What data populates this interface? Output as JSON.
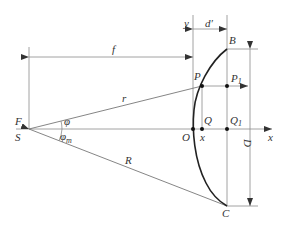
{
  "diagram": {
    "labels": {
      "f": "f",
      "y": "y",
      "d_prime": "d′",
      "B": "B",
      "P": "P",
      "P1": "P",
      "P1_sub": "1",
      "r": "r",
      "F": "F",
      "S": "S",
      "phi": "φ",
      "phi_m": "φ",
      "phi_m_sub": "m",
      "Q": "Q",
      "Q1": "Q",
      "Q1_sub": "1",
      "O": "O",
      "x_point": "x",
      "x_axis": "x",
      "D": "D",
      "R": "R",
      "C": "C"
    },
    "colors": {
      "line": "#8a8a8a",
      "curve": "#222222",
      "text": "#333333"
    }
  }
}
